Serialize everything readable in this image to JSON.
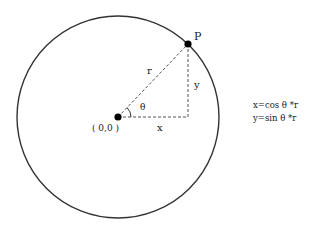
{
  "diagram": {
    "point_label": "P",
    "radius_label": "r",
    "x_label": "x",
    "y_label": "y",
    "angle_label": "θ",
    "origin_label": "( 0,0 )",
    "formulas": {
      "x": "x=cos θ *r",
      "y": "y=sin θ *r"
    },
    "colors": {
      "stroke": "#333333",
      "dashed": "#555555",
      "dot": "#000000"
    }
  }
}
